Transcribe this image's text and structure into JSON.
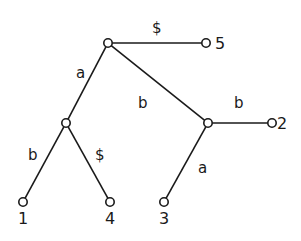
{
  "diagram": {
    "type": "suffix-tree",
    "nodes": [
      {
        "id": "root",
        "x": 108,
        "y": 43,
        "label": ""
      },
      {
        "id": "n5",
        "x": 206,
        "y": 43,
        "label": "5",
        "lx": 215,
        "ly": 49
      },
      {
        "id": "na",
        "x": 66,
        "y": 123,
        "label": ""
      },
      {
        "id": "nb",
        "x": 208,
        "y": 123,
        "label": ""
      },
      {
        "id": "n2",
        "x": 272,
        "y": 123,
        "label": "2",
        "lx": 277,
        "ly": 129
      },
      {
        "id": "n1",
        "x": 23,
        "y": 202,
        "label": "1",
        "lx": 18,
        "ly": 224
      },
      {
        "id": "n4",
        "x": 110,
        "y": 202,
        "label": "4",
        "lx": 105,
        "ly": 224
      },
      {
        "id": "n3",
        "x": 164,
        "y": 202,
        "label": "3",
        "lx": 159,
        "ly": 224
      }
    ],
    "edges": [
      {
        "from": "root",
        "to": "n5",
        "label": "$",
        "lx": 152,
        "ly": 33
      },
      {
        "from": "root",
        "to": "na",
        "label": "a",
        "lx": 76,
        "ly": 78
      },
      {
        "from": "root",
        "to": "nb",
        "label": "b",
        "lx": 138,
        "ly": 108
      },
      {
        "from": "nb",
        "to": "n2",
        "label": "b",
        "lx": 234,
        "ly": 108
      },
      {
        "from": "na",
        "to": "n1",
        "label": "b",
        "lx": 28,
        "ly": 160
      },
      {
        "from": "na",
        "to": "n4",
        "label": "$",
        "lx": 95,
        "ly": 160
      },
      {
        "from": "nb",
        "to": "n3",
        "label": "a",
        "lx": 198,
        "ly": 173
      }
    ],
    "leaf_labels": [
      "1",
      "2",
      "3",
      "4",
      "5"
    ],
    "edge_labels": [
      "$",
      "a",
      "b",
      "b",
      "b",
      "$",
      "a"
    ],
    "colors": {
      "ink": "#1a1a1a",
      "background": "#ffffff"
    }
  }
}
